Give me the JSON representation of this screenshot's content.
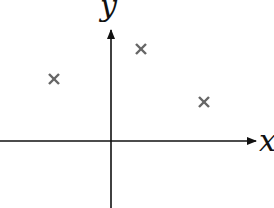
{
  "diagram": {
    "type": "coordinate-plane-scatter",
    "origin_px": [
      111,
      141
    ],
    "axes": {
      "x": {
        "label": "x",
        "from_px": 0,
        "to_px": 258,
        "color": "#111111"
      },
      "y": {
        "label": "y",
        "from_px": 208,
        "to_px": 28,
        "color": "#111111"
      }
    },
    "markers": [
      {
        "symbol": "×",
        "quadrant": "II",
        "x_px": 54,
        "y_px": 79
      },
      {
        "symbol": "×",
        "quadrant": "I",
        "x_px": 141,
        "y_px": 49
      },
      {
        "symbol": "×",
        "quadrant": "I",
        "x_px": 204,
        "y_px": 102
      }
    ],
    "marker_color": "#666666"
  }
}
